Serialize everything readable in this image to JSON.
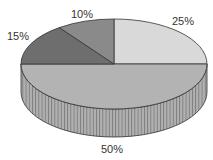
{
  "chart_data": {
    "type": "pie",
    "style": "3d",
    "title": "",
    "slices": [
      {
        "label": "25%",
        "value": 25,
        "color": "#d9d9d9"
      },
      {
        "label": "50%",
        "value": 50,
        "color": "#b3b3b3"
      },
      {
        "label": "15%",
        "value": 15,
        "color": "#6e6e6e"
      },
      {
        "label": "10%",
        "value": 10,
        "color": "#8a8a8a"
      }
    ],
    "side_color": "#a6a6a6",
    "outline_color": "#333333"
  }
}
